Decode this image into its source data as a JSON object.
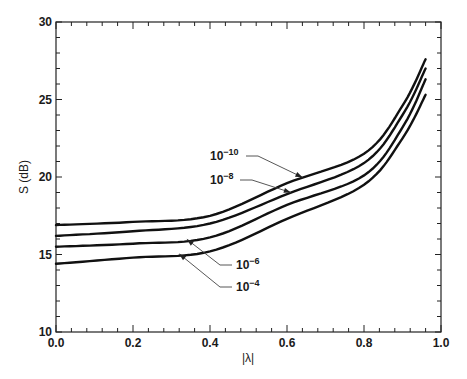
{
  "chart_data": {
    "type": "line",
    "title": "",
    "xlabel": "|λ|",
    "ylabel": "S (dB)",
    "xlim": [
      0.0,
      1.0
    ],
    "ylim": [
      10,
      30
    ],
    "x_ticks": [
      "0.0",
      "0.2",
      "0.4",
      "0.6",
      "0.8",
      "1.0"
    ],
    "y_ticks": [
      "10",
      "15",
      "20",
      "25",
      "30"
    ],
    "x_minor_step": 0.04,
    "y_minor_step": 1,
    "grid": false,
    "legend": "inline labels with leader arrows",
    "x": [
      0.0,
      0.2,
      0.4,
      0.6,
      0.8,
      0.9,
      0.96
    ],
    "series": [
      {
        "name": "10^-10",
        "label_base": "10",
        "label_exp": "−10",
        "values": [
          16.9,
          17.1,
          17.5,
          19.6,
          21.5,
          24.6,
          27.6
        ]
      },
      {
        "name": "10^-8",
        "label_base": "10",
        "label_exp": "−8",
        "values": [
          16.2,
          16.5,
          17.0,
          18.9,
          20.9,
          24.0,
          27.0
        ]
      },
      {
        "name": "10^-6",
        "label_base": "10",
        "label_exp": "−6",
        "values": [
          15.5,
          15.7,
          16.1,
          18.2,
          20.1,
          23.2,
          26.3
        ]
      },
      {
        "name": "10^-4",
        "label_base": "10",
        "label_exp": "−4",
        "values": [
          14.4,
          14.8,
          15.2,
          17.3,
          19.5,
          22.5,
          25.3
        ]
      }
    ],
    "annotations": [
      {
        "series": "10^-10",
        "text": "10^-10",
        "label_xy_px": [
          210,
          160
        ],
        "arrow_to_x": 0.64
      },
      {
        "series": "10^-8",
        "text": "10^-8",
        "label_xy_px": [
          210,
          184
        ],
        "arrow_to_x": 0.61
      },
      {
        "series": "10^-6",
        "text": "10^-6",
        "label_xy_px": [
          236,
          269
        ],
        "arrow_to_x": 0.34
      },
      {
        "series": "10^-4",
        "text": "10^-4",
        "label_xy_px": [
          236,
          291
        ],
        "arrow_to_x": 0.32
      }
    ]
  },
  "colors": {
    "curve": "#111111",
    "axis": "#222222",
    "background": "#ffffff"
  }
}
